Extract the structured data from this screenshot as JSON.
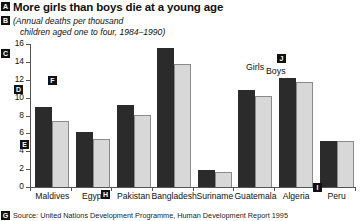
{
  "title": "More girls than boys die at a young age",
  "subtitle_line1": "(Annual deaths per thousand",
  "subtitle_line2": "children aged one to four, 1984–1990)",
  "source": "Source: United Nations Development Programme, Human Development Report 1995",
  "legend": {
    "girls": "Girls",
    "boys": "Boys"
  },
  "callouts": {
    "a": "A",
    "b": "B",
    "c": "C",
    "d": "D",
    "e": "E",
    "f": "F",
    "g": "G",
    "h": "H",
    "i": "I",
    "j": "J"
  },
  "colors": {
    "girls_bar": "#2b2b2b",
    "boys_bar": "#d8d8d8",
    "axis": "#555555",
    "text": "#111111"
  },
  "chart_data": {
    "type": "bar",
    "title": "More girls than boys die at a young age",
    "subtitle": "(Annual deaths per thousand children aged one to four, 1984–1990)",
    "xlabel": "",
    "ylabel": "",
    "ylim": [
      0,
      16
    ],
    "yticks": [
      0,
      2,
      4,
      6,
      8,
      10,
      12,
      14,
      16
    ],
    "grid": false,
    "legend_position": "top-right",
    "categories": [
      "Maldives",
      "Egypt",
      "Pakistan",
      "Bangladesh",
      "Suriname",
      "Guatemala",
      "Algeria",
      "Peru"
    ],
    "series": [
      {
        "name": "Girls",
        "values": [
          9.0,
          6.2,
          9.2,
          15.5,
          1.9,
          10.9,
          12.2,
          5.2
        ]
      },
      {
        "name": "Boys",
        "values": [
          7.4,
          5.4,
          8.1,
          13.8,
          1.7,
          10.2,
          11.8,
          5.1
        ]
      }
    ]
  }
}
